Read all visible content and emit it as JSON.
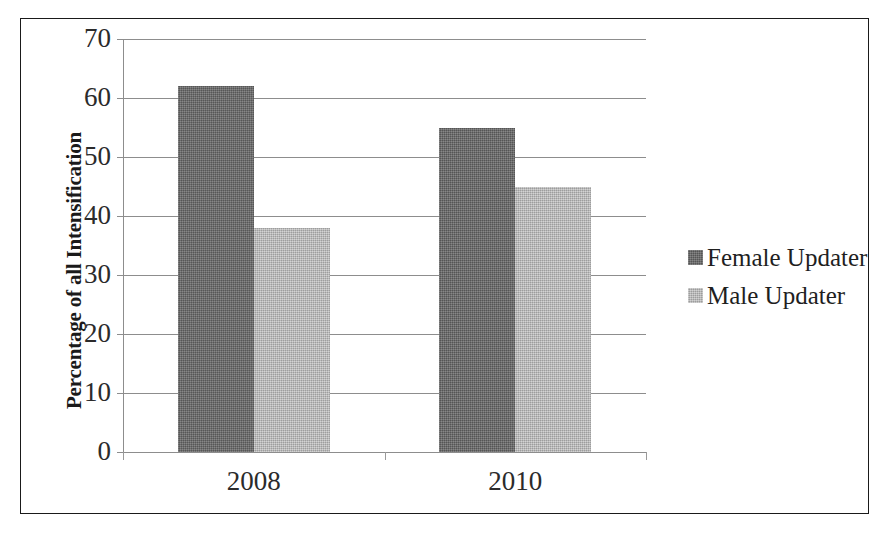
{
  "chart_data": {
    "type": "bar",
    "title": "",
    "subtitle": "",
    "xlabel": "",
    "ylabel": "Percentage of all Intensification",
    "categories": [
      "2008",
      "2010"
    ],
    "series": [
      {
        "name": "Female Updater",
        "values": [
          62,
          55
        ],
        "color": "#6a6a6a"
      },
      {
        "name": "Male Updater",
        "values": [
          38,
          45
        ],
        "color": "#b6b6b6"
      }
    ],
    "ylim": [
      0,
      70
    ],
    "y_ticks": [
      70,
      60,
      50,
      40,
      30,
      20,
      10,
      0
    ],
    "grid": true,
    "legend_position": "right",
    "background_color": "#ffffff",
    "axis_color": "#8d8d8d",
    "frame_color": "#1a1a1a"
  },
  "axis": {
    "y_title": "Percentage of all Intensification",
    "y_tick_labels": [
      "70",
      "60",
      "50",
      "40",
      "30",
      "20",
      "10",
      "0"
    ],
    "x_tick_labels": [
      "2008",
      "2010"
    ]
  },
  "legend": {
    "entries": [
      {
        "label": "Female Updater"
      },
      {
        "label": "Male Updater"
      }
    ]
  }
}
